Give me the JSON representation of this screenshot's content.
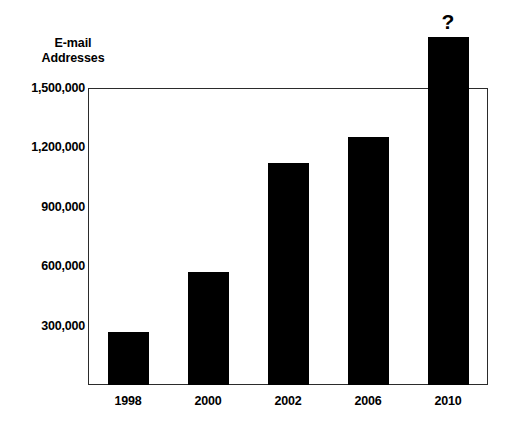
{
  "chart_data": {
    "type": "bar",
    "title": "",
    "subtitle": "",
    "ylabel": "E-mail Addresses",
    "ylabel_lines": [
      "E-mail",
      "Addresses"
    ],
    "xlabel": "",
    "categories": [
      "1998",
      "2000",
      "2002",
      "2006",
      "2010"
    ],
    "values": [
      270000,
      570000,
      1120000,
      1255000,
      1760000
    ],
    "value_labels": [
      "",
      "",
      "",
      "",
      "?"
    ],
    "ylim": [
      0,
      1500000
    ],
    "yticks": [
      1500000,
      1200000,
      900000,
      600000,
      300000
    ],
    "ytick_labels": [
      "1,500,000",
      "1,200,000",
      "900,000",
      "600,000",
      "300,000"
    ],
    "grid": false,
    "legend": false,
    "legend_position": "none",
    "bar_color": "#000000",
    "axis_color": "#2b2b2b",
    "background_color": "#ffffff",
    "annotations": [
      {
        "text": "?",
        "category": "2010",
        "placement": "above-bar",
        "note": "2010 bar extends above the plot frame top; its value is unknown"
      }
    ]
  },
  "axis_title": {
    "line1": "E-mail",
    "line2": "Addresses"
  }
}
